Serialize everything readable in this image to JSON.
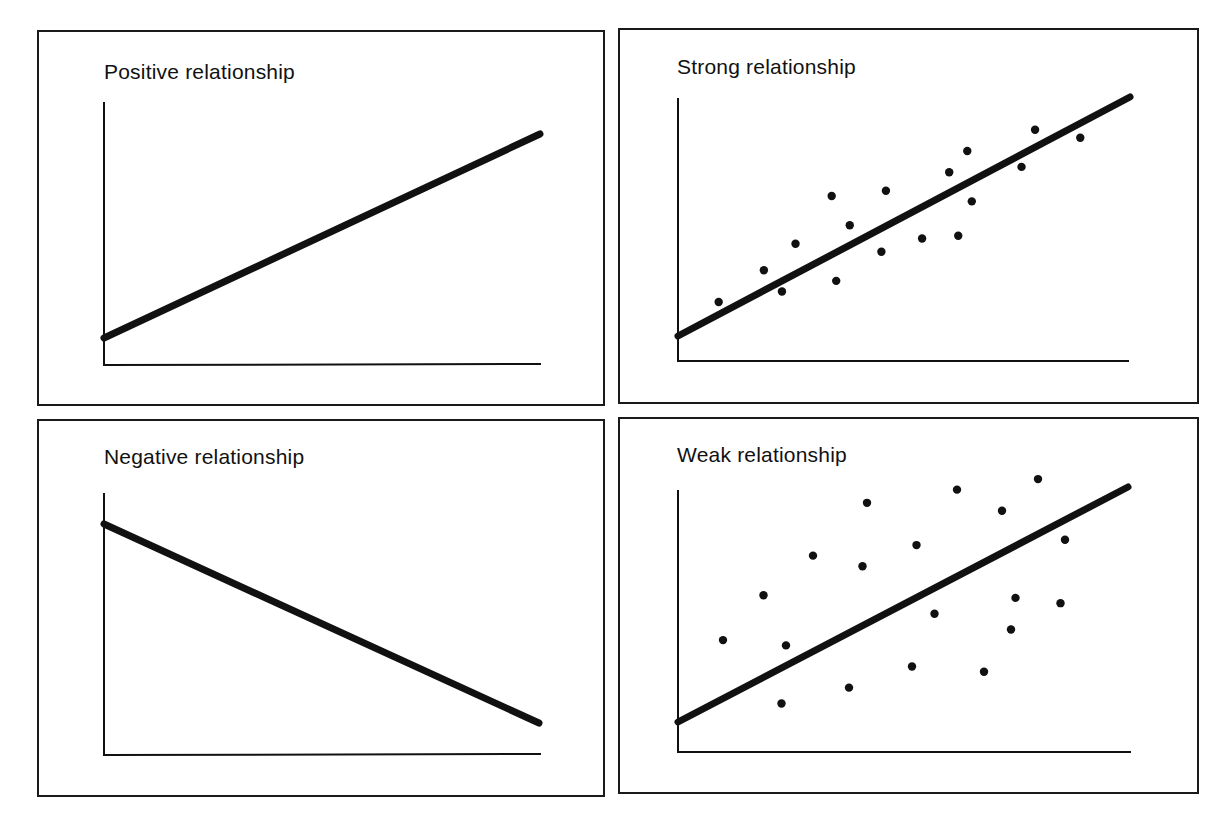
{
  "figure": {
    "panels": [
      {
        "id": "positive",
        "title": "Positive relationship"
      },
      {
        "id": "strong",
        "title": "Strong relationship"
      },
      {
        "id": "negative",
        "title": "Negative relationship"
      },
      {
        "id": "weak",
        "title": "Weak relationship"
      }
    ],
    "colors": {
      "ink": "#111111",
      "background": "#ffffff"
    }
  },
  "chart_data": [
    {
      "type": "line",
      "title": "Positive relationship",
      "xlabel": "",
      "ylabel": "",
      "grid": false,
      "x": [
        0,
        100
      ],
      "y": [
        10.5,
        88
      ]
    },
    {
      "type": "scatter",
      "title": "Strong relationship",
      "xlabel": "",
      "ylabel": "",
      "grid": false,
      "trend_line": {
        "x": [
          0,
          100
        ],
        "y": [
          10,
          100
        ]
      },
      "points": [
        {
          "x": 9,
          "y": 23
        },
        {
          "x": 19,
          "y": 35
        },
        {
          "x": 23,
          "y": 27
        },
        {
          "x": 26,
          "y": 45
        },
        {
          "x": 34,
          "y": 63
        },
        {
          "x": 35,
          "y": 31
        },
        {
          "x": 38,
          "y": 52
        },
        {
          "x": 46,
          "y": 65
        },
        {
          "x": 45,
          "y": 42
        },
        {
          "x": 54,
          "y": 47
        },
        {
          "x": 60,
          "y": 72
        },
        {
          "x": 62,
          "y": 48
        },
        {
          "x": 64,
          "y": 80
        },
        {
          "x": 65,
          "y": 61
        },
        {
          "x": 76,
          "y": 74
        },
        {
          "x": 79,
          "y": 88
        },
        {
          "x": 89,
          "y": 85
        }
      ]
    },
    {
      "type": "line",
      "title": "Negative relationship",
      "xlabel": "",
      "ylabel": "",
      "grid": false,
      "x": [
        0,
        100
      ],
      "y": [
        88,
        12
      ]
    },
    {
      "type": "scatter",
      "title": "Weak relationship",
      "xlabel": "",
      "ylabel": "",
      "grid": false,
      "trend_line": {
        "x": [
          0,
          100
        ],
        "y": [
          11,
          100
        ]
      },
      "points": [
        {
          "x": 10,
          "y": 42
        },
        {
          "x": 19,
          "y": 59
        },
        {
          "x": 24,
          "y": 40
        },
        {
          "x": 23,
          "y": 18
        },
        {
          "x": 30,
          "y": 74
        },
        {
          "x": 38,
          "y": 24
        },
        {
          "x": 41,
          "y": 70
        },
        {
          "x": 42,
          "y": 94
        },
        {
          "x": 53,
          "y": 78
        },
        {
          "x": 52,
          "y": 32
        },
        {
          "x": 57,
          "y": 52
        },
        {
          "x": 62,
          "y": 99
        },
        {
          "x": 68,
          "y": 30
        },
        {
          "x": 72,
          "y": 91
        },
        {
          "x": 74,
          "y": 46
        },
        {
          "x": 75,
          "y": 58
        },
        {
          "x": 80,
          "y": 103
        },
        {
          "x": 85,
          "y": 56
        },
        {
          "x": 86,
          "y": 80
        }
      ]
    }
  ]
}
